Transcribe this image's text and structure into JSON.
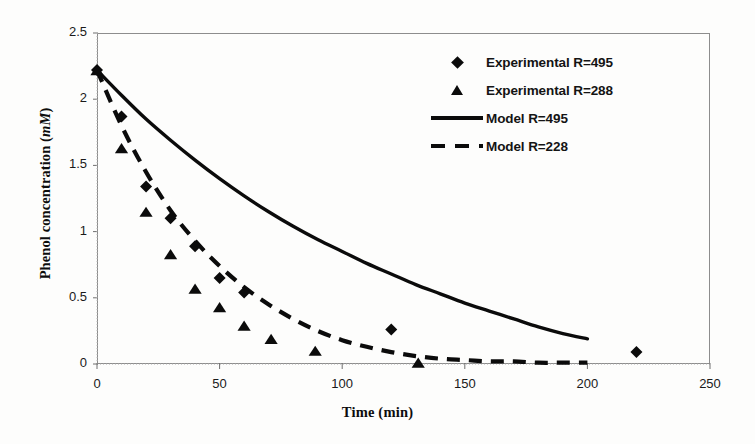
{
  "chart_data": {
    "type": "scatter",
    "title": "",
    "xlabel": "Time (min)",
    "ylabel": "Phenol concentration (mM)",
    "ylabel_main": "Phenol concentration (",
    "ylabel_unit": "mM",
    "ylabel_close": ")",
    "xlim": [
      0,
      250
    ],
    "ylim": [
      0,
      2.5
    ],
    "xticks": [
      0,
      50,
      100,
      150,
      200,
      250
    ],
    "yticks": [
      0,
      0.5,
      1,
      1.5,
      2,
      2.5
    ],
    "xtick_labels": [
      "0",
      "50",
      "100",
      "150",
      "200",
      "250"
    ],
    "ytick_labels": [
      "0",
      "0.5",
      "1",
      "1.5",
      "2",
      "2.5"
    ],
    "grid": false,
    "legend_position": "top-right",
    "series": [
      {
        "name": "Experimental R=495",
        "marker": "diamond",
        "kind": "points",
        "x": [
          0,
          10,
          20,
          30,
          40,
          50,
          60,
          120,
          220
        ],
        "y": [
          2.22,
          1.87,
          1.34,
          1.1,
          0.89,
          0.65,
          0.54,
          0.26,
          0.09
        ]
      },
      {
        "name": "Experimental R=288",
        "marker": "triangle",
        "kind": "points",
        "x": [
          0,
          10,
          20,
          30,
          40,
          50,
          60,
          71,
          89,
          131
        ],
        "y": [
          2.22,
          1.63,
          1.15,
          0.83,
          0.57,
          0.43,
          0.29,
          0.19,
          0.1,
          0.01
        ]
      },
      {
        "name": "Model R=495",
        "marker": "none",
        "kind": "line",
        "style": "solid",
        "x": [
          0,
          10,
          20,
          30,
          40,
          50,
          60,
          70,
          80,
          90,
          100,
          110,
          120,
          130,
          140,
          150,
          160,
          170,
          180,
          190,
          200
        ],
        "y": [
          2.22,
          2.03,
          1.85,
          1.69,
          1.54,
          1.4,
          1.27,
          1.15,
          1.04,
          0.94,
          0.85,
          0.76,
          0.68,
          0.6,
          0.53,
          0.46,
          0.4,
          0.34,
          0.28,
          0.23,
          0.19
        ]
      },
      {
        "name": "Model R=228",
        "marker": "none",
        "kind": "line",
        "style": "dashed",
        "x": [
          0,
          10,
          20,
          30,
          40,
          50,
          60,
          70,
          80,
          90,
          100,
          110,
          120,
          130,
          140,
          150,
          160,
          170,
          180,
          190,
          200
        ],
        "y": [
          2.22,
          1.8,
          1.45,
          1.16,
          0.93,
          0.74,
          0.58,
          0.45,
          0.34,
          0.25,
          0.18,
          0.13,
          0.09,
          0.06,
          0.04,
          0.03,
          0.02,
          0.02,
          0.01,
          0.01,
          0.01
        ]
      }
    ]
  },
  "legend": {
    "items": [
      {
        "label": "Experimental R=495",
        "key": "diamond-marker"
      },
      {
        "label": "Experimental R=288",
        "key": "triangle-marker"
      },
      {
        "label": "Model R=495",
        "key": "solid-line"
      },
      {
        "label": "Model R=228",
        "key": "dashed-line"
      }
    ]
  },
  "colors": {
    "ink": "#0b0b0b",
    "frame": "#8d8d8d",
    "background": "#fdfdfc"
  }
}
